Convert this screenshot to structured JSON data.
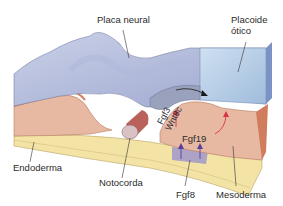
{
  "diagram": {
    "title": "",
    "labels": {
      "neural_plate": "Placa neural",
      "otic_placode_line1": "Placoide",
      "otic_placode_line2": "ótico",
      "endoderm": "Endoderma",
      "notochord": "Notocorda",
      "fgf8": "Fgf8",
      "mesoderm": "Mesoderma",
      "fgf19": "Fgf19",
      "fgf3": "Fgf3",
      "wnt8c": "Wnt8c"
    },
    "layers": [
      {
        "name": "ectoderm",
        "color": "#aeb9d8"
      },
      {
        "name": "otic-placode",
        "color": "#a9c4e0"
      },
      {
        "name": "mesoderm",
        "color": "#e7b9a2"
      },
      {
        "name": "mesoderm-edge",
        "color": "#d27c5e"
      },
      {
        "name": "endoderm",
        "color": "#f3e3a4"
      },
      {
        "name": "notochord",
        "color": "#d9c2c6"
      },
      {
        "name": "fgf8-region",
        "color": "#a59bc9"
      }
    ],
    "arrow_colors": {
      "signal_red": "#d8344a",
      "signal_purple": "#5a3f9a",
      "black": "#1a1a1a"
    }
  }
}
